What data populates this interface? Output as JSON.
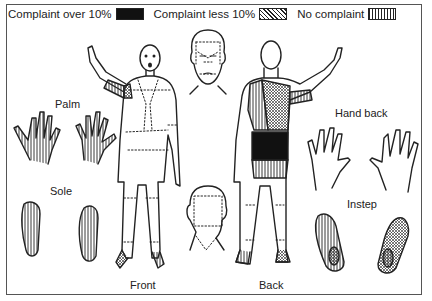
{
  "legend": {
    "items": [
      {
        "label": "Complaint over 10%",
        "pattern": "solid-black"
      },
      {
        "label": "Complaint less 10%",
        "pattern": "cross-hatch"
      },
      {
        "label": "No complaint",
        "pattern": "vertical-lines"
      }
    ]
  },
  "labels": {
    "palm": "Palm",
    "sole": "Sole",
    "front": "Front",
    "back": "Back",
    "hand_back": "Hand back",
    "instep": "Instep"
  },
  "colors": {
    "line": "#222222",
    "fill_black": "#111111",
    "background": "#ffffff"
  }
}
